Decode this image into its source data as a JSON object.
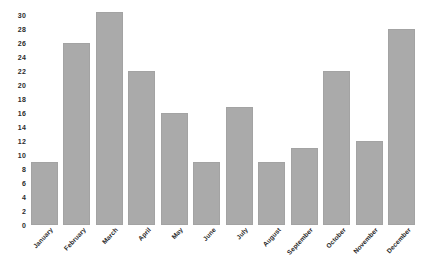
{
  "chart_data": {
    "type": "bar",
    "title": "",
    "subtitle": "",
    "xlabel": "",
    "ylabel": "",
    "categories": [
      "January",
      "February",
      "March",
      "April",
      "May",
      "June",
      "July",
      "August",
      "September",
      "October",
      "November",
      "December"
    ],
    "values": [
      9,
      26,
      30.5,
      22,
      16,
      9,
      16.8,
      9,
      11,
      22,
      12,
      28
    ],
    "series": [
      {
        "name": "",
        "values": [
          9,
          26,
          30.5,
          22,
          16,
          9,
          16.8,
          9,
          11,
          22,
          12,
          28
        ]
      }
    ],
    "ylim": [
      0,
      31
    ],
    "yticks": [
      0,
      2,
      4,
      6,
      8,
      10,
      12,
      14,
      16,
      18,
      20,
      22,
      24,
      26,
      28,
      30
    ],
    "ytick_labels": [
      "0",
      "2",
      "4",
      "6",
      "8",
      "10",
      "12",
      "14",
      "16",
      "18",
      "20",
      "22",
      "24",
      "26",
      "28",
      "30"
    ],
    "grid": false,
    "legend": false,
    "legend_position": "none",
    "bar_color": "#aaaaaa",
    "background_color": "#ffffff",
    "xtick_rotation": -47
  }
}
